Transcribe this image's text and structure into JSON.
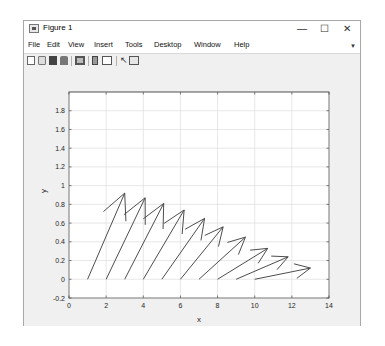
{
  "window": {
    "title": "Figure 1",
    "controls": {
      "minimize": "—",
      "maximize": "☐",
      "close": "✕"
    }
  },
  "menubar": {
    "items": [
      "File",
      "Edit",
      "View",
      "Insert",
      "Tools",
      "Desktop",
      "Window",
      "Help"
    ],
    "overflow_icon": "dock-arrow-icon"
  },
  "toolbar": {
    "icons": [
      "new-figure-icon",
      "open-file-icon",
      "save-icon",
      "print-icon",
      "link-plot-icon",
      "insert-colorbar-icon",
      "insert-legend-icon",
      "edit-plot-icon",
      "property-inspector-icon"
    ]
  },
  "chart_data": {
    "type": "quiver",
    "title": "",
    "xlabel": "x",
    "ylabel": "y",
    "xlim": [
      0,
      14
    ],
    "ylim": [
      -0.2,
      2.0
    ],
    "xticks": [
      0,
      2,
      4,
      6,
      8,
      10,
      12,
      14
    ],
    "xtick_labels": [
      "0",
      "2",
      "4",
      "6",
      "8",
      "10",
      "12",
      "14"
    ],
    "yticks": [
      -0.2,
      0,
      0.2,
      0.4,
      0.6,
      0.8,
      1,
      1.2,
      1.4,
      1.6,
      1.8
    ],
    "ytick_labels": [
      "-0.2",
      "0",
      "0.2",
      "0.4",
      "0.6",
      "0.8",
      "1",
      "1.2",
      "1.4",
      "1.6",
      "1.8"
    ],
    "grid": true,
    "color": "#4d4d4d",
    "arrows": [
      {
        "x": 1,
        "y": 0,
        "u": 2.0,
        "v": 0.92
      },
      {
        "x": 2,
        "y": 0,
        "u": 2.1,
        "v": 0.87
      },
      {
        "x": 3,
        "y": 0,
        "u": 2.1,
        "v": 0.81
      },
      {
        "x": 4,
        "y": 0,
        "u": 2.2,
        "v": 0.74
      },
      {
        "x": 5,
        "y": 0,
        "u": 2.3,
        "v": 0.65
      },
      {
        "x": 6,
        "y": 0,
        "u": 2.3,
        "v": 0.56
      },
      {
        "x": 7,
        "y": 0,
        "u": 2.5,
        "v": 0.45
      },
      {
        "x": 8,
        "y": 0,
        "u": 2.7,
        "v": 0.33
      },
      {
        "x": 9,
        "y": 0,
        "u": 2.8,
        "v": 0.24
      },
      {
        "x": 10,
        "y": 0,
        "u": 3.0,
        "v": 0.12
      }
    ]
  }
}
